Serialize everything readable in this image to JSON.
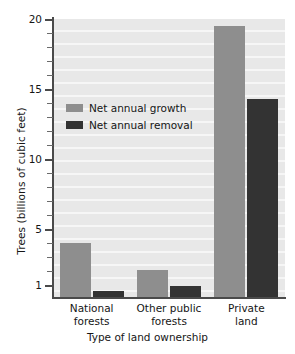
{
  "chart_data": {
    "type": "bar",
    "title": "",
    "xlabel": "Type of land ownership",
    "ylabel": "Trees (billions of cubic feet)",
    "categories": [
      "National forests",
      "Other public forests",
      "Private land"
    ],
    "category_lines": [
      [
        "National",
        "forests"
      ],
      [
        "Other public",
        "forests"
      ],
      [
        "Private",
        "land"
      ]
    ],
    "series": [
      {
        "name": "Net annual growth",
        "color": "#8e8e8e",
        "values": [
          4.0,
          2.1,
          19.5
        ]
      },
      {
        "name": "Net annual removal",
        "color": "#333333",
        "values": [
          0.6,
          0.9,
          14.3
        ]
      }
    ],
    "ylim": [
      0,
      20
    ],
    "ytick_labels": [
      "20",
      "15",
      "10",
      "5",
      "1"
    ],
    "ytick_values": [
      20,
      15,
      10,
      5,
      1
    ],
    "yminor_values": [
      19,
      18,
      17,
      16,
      14,
      13,
      12,
      11,
      9,
      8,
      7,
      6,
      4,
      3,
      2
    ],
    "grid": "horizontal",
    "legend_position": "upper-left-inside",
    "plot_background": "#e8e8e8"
  }
}
